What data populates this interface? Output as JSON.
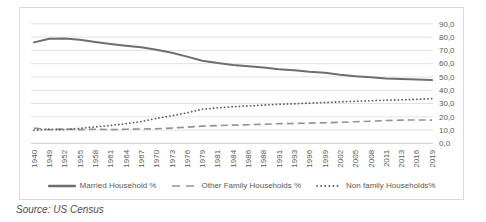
{
  "source_note": "Source: US Census",
  "colors": {
    "background": "#ffffff",
    "frame_border": "#d9d9d9",
    "gridline": "#e2e2e2",
    "axis_line": "#d0d0d0",
    "tick_text": "#595959",
    "legend_text": "#595959",
    "source_text": "#4d4d4d"
  },
  "chart_data": {
    "type": "line",
    "title": "",
    "xlabel": "",
    "ylabel": "",
    "grid": "horizontal",
    "legend_position": "bottom",
    "decimal_format": "comma",
    "ylim": [
      0,
      90
    ],
    "ytick_values": [
      90,
      80,
      70,
      60,
      50,
      40,
      30,
      20,
      10,
      0
    ],
    "ytick_labels": [
      "90,0",
      "80,0",
      "70,0",
      "60,0",
      "50,0",
      "40,0",
      "30,0",
      "20,0",
      "10,0",
      "0,0"
    ],
    "categories": [
      "1940",
      "1949",
      "1952",
      "1955",
      "1958",
      "1961",
      "1964",
      "1967",
      "1970",
      "1973",
      "1976",
      "1979",
      "1981",
      "1984",
      "1986",
      "1988",
      "1991",
      "1993",
      "1996",
      "1999",
      "2002",
      "2005",
      "2008",
      "2011",
      "2013",
      "2016",
      "2019"
    ],
    "series": [
      {
        "name": "Married Household %",
        "style": "solid",
        "color": "#6e6e6e",
        "values": [
          76.0,
          78.8,
          79.0,
          78.0,
          76.3,
          74.8,
          73.5,
          72.3,
          70.5,
          68.2,
          65.3,
          62.2,
          60.5,
          59.0,
          58.1,
          57.1,
          55.8,
          55.1,
          53.9,
          53.1,
          51.7,
          50.6,
          49.8,
          48.9,
          48.4,
          48.0,
          47.6
        ]
      },
      {
        "name": "Other Family Households %",
        "style": "dashed",
        "color": "#929292",
        "values": [
          11.5,
          10.3,
          10.8,
          10.4,
          10.6,
          10.4,
          10.6,
          10.8,
          11.0,
          11.5,
          12.2,
          13.0,
          13.4,
          13.8,
          14.1,
          14.4,
          14.8,
          15.0,
          15.3,
          15.5,
          15.9,
          16.3,
          16.7,
          17.2,
          17.5,
          17.6,
          17.5
        ]
      },
      {
        "name": "Non family Households%",
        "style": "dotted",
        "color": "#5f5f5f",
        "values": [
          10.0,
          10.7,
          10.4,
          11.3,
          12.4,
          13.5,
          14.8,
          16.4,
          18.8,
          20.8,
          23.0,
          25.7,
          26.7,
          27.6,
          28.2,
          28.8,
          29.4,
          29.8,
          30.3,
          30.8,
          31.3,
          31.7,
          32.1,
          32.5,
          32.8,
          33.2,
          33.6
        ]
      }
    ]
  }
}
